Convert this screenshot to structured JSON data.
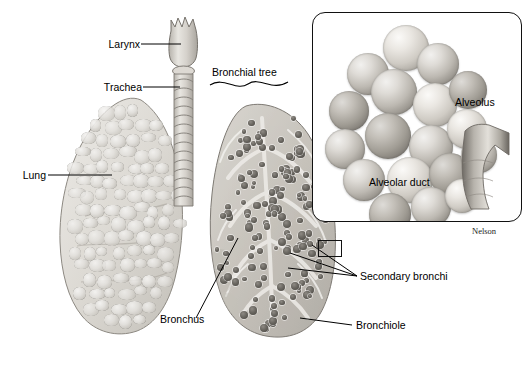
{
  "figure": {
    "credit": "Nelson",
    "background": "#ffffff",
    "line_color": "#000000"
  },
  "labels": {
    "larynx": "Larynx",
    "trachea": "Trachea",
    "lung": "Lung",
    "bronchial_tree": "Bronchial tree",
    "bronchus": "Bronchus",
    "secondary_bronchi": "Secondary bronchi",
    "bronchiole": "Bronchiole",
    "alveolus": "Alveolus",
    "alveolar_duct": "Alveolar duct"
  },
  "structures": {
    "larynx": {
      "name": "larynx",
      "tone": "#d8d5cf"
    },
    "trachea": {
      "name": "trachea",
      "rings": 14,
      "tone": "#ddd9d3"
    },
    "left_lung": {
      "name": "left-lung-exterior",
      "surface": "lobulated",
      "tone": "#ddd9d3"
    },
    "right_lung": {
      "name": "right-lung-cutaway",
      "surface": "cut-section",
      "tone": "#c9c5be"
    },
    "alveoli_cluster": {
      "name": "alveoli-cluster",
      "count": 18
    },
    "alveolar_duct": {
      "name": "alveolar-duct",
      "shape": "Y-branch"
    }
  },
  "inset": {
    "name": "alveoli-detail-inset",
    "border_radius_px": 13,
    "border_color": "#111111"
  },
  "callout_box": {
    "name": "detail-region-box",
    "note": "small rectangle marking magnified region on right lung"
  }
}
